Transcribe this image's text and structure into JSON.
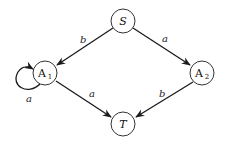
{
  "diagram": {
    "type": "state-transition-graph",
    "nodes": [
      {
        "id": "S",
        "label": "S",
        "sub": "",
        "cx": 123,
        "cy": 21
      },
      {
        "id": "A1",
        "label": "A",
        "sub": "1",
        "cx": 45,
        "cy": 73
      },
      {
        "id": "A2",
        "label": "A",
        "sub": "2",
        "cx": 202,
        "cy": 73
      },
      {
        "id": "T",
        "label": "T",
        "sub": "",
        "cx": 123,
        "cy": 124
      }
    ],
    "edges": [
      {
        "from": "S",
        "to": "A1",
        "label": "b"
      },
      {
        "from": "S",
        "to": "A2",
        "label": "a"
      },
      {
        "from": "A1",
        "to": "A1",
        "label": "a"
      },
      {
        "from": "A1",
        "to": "T",
        "label": "a"
      },
      {
        "from": "A2",
        "to": "T",
        "label": "b"
      }
    ]
  },
  "labels": {
    "S": "S",
    "A1": "A",
    "A1_sub": "1",
    "A2": "A",
    "A2_sub": "2",
    "T": "T",
    "edge_S_A1": "b",
    "edge_S_A2": "a",
    "edge_A1_loop": "a",
    "edge_A1_T": "a",
    "edge_A2_T": "b"
  }
}
